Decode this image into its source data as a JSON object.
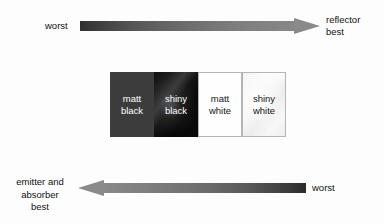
{
  "diagram": {
    "background_color": "#fdfdfd",
    "text_color": "#111111"
  },
  "top_scale": {
    "name": "reflector-scale",
    "direction": "left-to-right",
    "left_label": "worst",
    "right_label_line1": "reflector",
    "right_label_line2": "best",
    "gradient_from": "#2f2f2f",
    "gradient_to": "#8a8a8a",
    "arrow_head_color": "#8a8a8a"
  },
  "swatches": [
    {
      "name": "matt-black",
      "line1": "matt",
      "line2": "black",
      "fill": "#3c3c3c",
      "text_color": "#ffffff",
      "bordered": false
    },
    {
      "name": "shiny-black",
      "line1": "shiny",
      "line2": "black",
      "fill": "#0a0a0a",
      "text_color": "#ffffff",
      "bordered": false
    },
    {
      "name": "matt-white",
      "line1": "matt",
      "line2": "white",
      "fill": "#fefefe",
      "text_color": "#151515",
      "bordered": true
    },
    {
      "name": "shiny-white",
      "line1": "shiny",
      "line2": "white",
      "fill": "#f4f4f4",
      "text_color": "#151515",
      "bordered": true
    }
  ],
  "bottom_scale": {
    "name": "emitter-absorber-scale",
    "direction": "right-to-left",
    "left_label_line1": "emitter and",
    "left_label_line2": "absorber",
    "left_label_line3": "best",
    "right_label": "worst",
    "gradient_from": "#8a8a8a",
    "gradient_to": "#2b2b2b",
    "arrow_head_color": "#8a8a8a"
  }
}
